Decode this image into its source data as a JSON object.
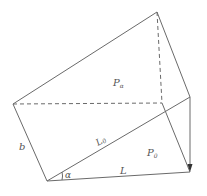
{
  "diagram": {
    "type": "geometric-figure",
    "stroke_color": "#666666",
    "labels": {
      "p_alpha": {
        "main": "P",
        "sub": "α"
      },
      "p_zero": {
        "main": "P",
        "sub": "0"
      },
      "l_zero": {
        "main": "L",
        "sub": "0"
      },
      "b": "b",
      "alpha": "α",
      "l": "L"
    }
  }
}
